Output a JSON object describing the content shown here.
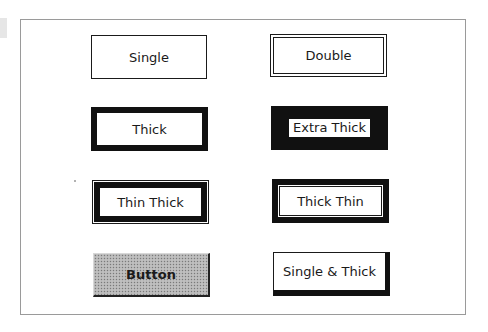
{
  "diagram": {
    "boxes": [
      {
        "id": "single",
        "label": "Single",
        "style": "single"
      },
      {
        "id": "double",
        "label": "Double",
        "style": "double"
      },
      {
        "id": "thick",
        "label": "Thick",
        "style": "thick"
      },
      {
        "id": "extra-thick",
        "label": "Extra Thick",
        "style": "extra-thick"
      },
      {
        "id": "thin-thick",
        "label": "Thin Thick",
        "style": "thin-thick"
      },
      {
        "id": "thick-thin",
        "label": "Thick Thin",
        "style": "thick-thin"
      },
      {
        "id": "button",
        "label": "Button",
        "style": "button"
      },
      {
        "id": "single-thick",
        "label": "Single & Thick",
        "style": "single-and-thick"
      }
    ],
    "colors": {
      "border": "#111111",
      "frame": "#9a9a9a",
      "background": "#ffffff",
      "button_fill": "#b5b5b5"
    }
  }
}
